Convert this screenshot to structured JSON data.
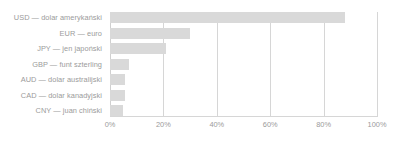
{
  "chart": {
    "type": "bar",
    "orientation": "horizontal",
    "bar_color": "#d9d9d9",
    "gridline_color": "#d6d6d6",
    "label_color": "#9b9b9b",
    "background_color": "#ffffff"
  },
  "chart_data": {
    "type": "bar",
    "title": "",
    "xlabel": "",
    "ylabel": "",
    "orientation": "horizontal",
    "grid": true,
    "legend": false,
    "xlim": [
      0,
      100
    ],
    "x_tick_labels": [
      "0%",
      "20%",
      "40%",
      "60%",
      "80%",
      "100%"
    ],
    "x_tick_values": [
      0,
      20,
      40,
      60,
      80,
      100
    ],
    "categories": [
      "USD — dolar amerykański",
      "EUR — euro",
      "JPY — jen japoński",
      "GBP — funt szterling",
      "AUD — dolar australijski",
      "CAD — dolar kanadyjski",
      "CNY — juan chiński"
    ],
    "values": [
      88,
      30,
      21,
      7,
      5.5,
      5.5,
      5
    ],
    "series": [
      {
        "name": "",
        "values": [
          88,
          30,
          21,
          7,
          5.5,
          5.5,
          5
        ]
      }
    ]
  }
}
